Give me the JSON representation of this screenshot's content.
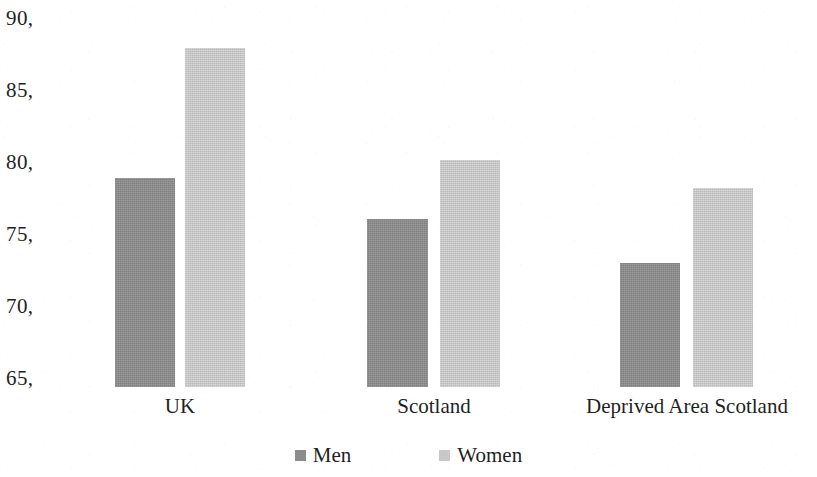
{
  "chart_data": {
    "type": "bar",
    "title": "",
    "subtitle": "",
    "xlabel": "",
    "ylabel": "",
    "categories": [
      "UK",
      "Scotland",
      "Deprived Area Scotland"
    ],
    "series": [
      {
        "name": "Men",
        "color": "#8c8c8c",
        "values": [
          79.7,
          76.8,
          73.7
        ]
      },
      {
        "name": "Women",
        "color": "#c8c8c8",
        "values": [
          88.9,
          81.0,
          79.0
        ]
      }
    ],
    "ylim": [
      65,
      90
    ],
    "ytick_values": [
      90,
      85,
      80,
      75,
      70,
      65
    ],
    "ytick_labels": [
      "90,",
      "85,",
      "80,",
      "75,",
      "70,",
      "65,"
    ],
    "grid": false,
    "legend_position": "bottom",
    "annotations": []
  },
  "axis": {
    "y_ticks": [
      {
        "label": "90,",
        "value": 90
      },
      {
        "label": "85,",
        "value": 85
      },
      {
        "label": "80,",
        "value": 80
      },
      {
        "label": "75,",
        "value": 75
      },
      {
        "label": "70,",
        "value": 70
      },
      {
        "label": "65,",
        "value": 65
      }
    ]
  },
  "categories": [
    {
      "label": "UK"
    },
    {
      "label": "Scotland"
    },
    {
      "label": "Deprived Area Scotland"
    }
  ],
  "legend": {
    "items": [
      {
        "label": "Men",
        "color": "#8c8c8c"
      },
      {
        "label": "Women",
        "color": "#c8c8c8"
      }
    ]
  }
}
